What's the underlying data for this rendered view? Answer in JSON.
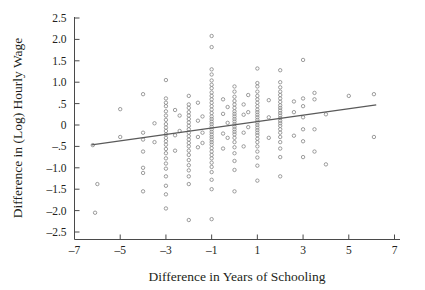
{
  "figure": {
    "background_color": "#ffffff",
    "ink_color": "#231f20",
    "axis_color": "#4a4a4a",
    "marker_color": "#8a8a8a",
    "fitline_color": "#5a5a5a"
  },
  "chart_data": {
    "type": "scatter",
    "title": "",
    "subtitle": "",
    "xlabel": "Difference in Years of Schooling",
    "ylabel": "Difference in (Log) Hourly Wage",
    "xlim": [
      -7,
      7
    ],
    "ylim": [
      -2.5,
      2.5
    ],
    "grid": false,
    "legend": null,
    "xticks": [
      -7,
      -5,
      -3,
      -1,
      1,
      3,
      5,
      7
    ],
    "xticklabels": [
      "–7",
      "–5",
      "–3",
      "–1",
      "1",
      "3",
      "5",
      "7"
    ],
    "yticks": [
      2.5,
      2.0,
      1.5,
      1.0,
      0.5,
      0,
      -0.5,
      -1.0,
      -1.5,
      -2.0,
      -2.5
    ],
    "yticklabels": [
      "2.5",
      "2.0",
      "1.5",
      "1.0",
      ".5",
      "0",
      "–.5",
      "–1.0",
      "–1.5",
      "–2.0",
      "–2.5"
    ],
    "annotations": [],
    "series": [
      {
        "name": "twin pairs",
        "marker": "open-circle",
        "points": [
          [
            -6.2,
            -0.47
          ],
          [
            -6.0,
            -1.38
          ],
          [
            -6.1,
            -2.05
          ],
          [
            -5.0,
            0.37
          ],
          [
            -5.0,
            -0.28
          ],
          [
            -4.0,
            0.72
          ],
          [
            -4.0,
            -0.18
          ],
          [
            -4.0,
            -0.34
          ],
          [
            -4.0,
            -0.62
          ],
          [
            -4.0,
            -1.0
          ],
          [
            -4.0,
            -1.12
          ],
          [
            -4.0,
            -1.55
          ],
          [
            -3.5,
            0.04
          ],
          [
            -3.5,
            -0.4
          ],
          [
            -3.0,
            1.05
          ],
          [
            -3.0,
            0.62
          ],
          [
            -3.0,
            0.52
          ],
          [
            -3.0,
            0.44
          ],
          [
            -3.0,
            0.32
          ],
          [
            -3.0,
            0.22
          ],
          [
            -3.0,
            0.12
          ],
          [
            -3.0,
            0.02
          ],
          [
            -3.0,
            -0.06
          ],
          [
            -3.0,
            -0.14
          ],
          [
            -3.0,
            -0.22
          ],
          [
            -3.0,
            -0.3
          ],
          [
            -3.0,
            -0.38
          ],
          [
            -3.0,
            -0.46
          ],
          [
            -3.0,
            -0.56
          ],
          [
            -3.0,
            -0.66
          ],
          [
            -3.0,
            -0.78
          ],
          [
            -3.0,
            -0.9
          ],
          [
            -3.0,
            -1.02
          ],
          [
            -3.0,
            -1.2
          ],
          [
            -3.0,
            -1.42
          ],
          [
            -3.0,
            -1.62
          ],
          [
            -3.0,
            -1.95
          ],
          [
            -2.6,
            0.35
          ],
          [
            -2.6,
            -0.24
          ],
          [
            -2.6,
            -0.6
          ],
          [
            -2.4,
            0.22
          ],
          [
            -2.4,
            -0.14
          ],
          [
            -2.0,
            0.68
          ],
          [
            -2.0,
            0.48
          ],
          [
            -2.0,
            0.4
          ],
          [
            -2.0,
            0.3
          ],
          [
            -2.0,
            0.22
          ],
          [
            -2.0,
            0.14
          ],
          [
            -2.0,
            0.06
          ],
          [
            -2.0,
            -0.02
          ],
          [
            -2.0,
            -0.1
          ],
          [
            -2.0,
            -0.18
          ],
          [
            -2.0,
            -0.26
          ],
          [
            -2.0,
            -0.34
          ],
          [
            -2.0,
            -0.42
          ],
          [
            -2.0,
            -0.5
          ],
          [
            -2.0,
            -0.6
          ],
          [
            -2.0,
            -0.7
          ],
          [
            -2.0,
            -0.82
          ],
          [
            -2.0,
            -0.94
          ],
          [
            -2.0,
            -1.06
          ],
          [
            -2.0,
            -1.2
          ],
          [
            -2.0,
            -1.38
          ],
          [
            -2.0,
            -2.22
          ],
          [
            -1.6,
            0.52
          ],
          [
            -1.6,
            0.1
          ],
          [
            -1.6,
            -0.28
          ],
          [
            -1.6,
            -0.52
          ],
          [
            -1.4,
            0.2
          ],
          [
            -1.4,
            -0.18
          ],
          [
            -1.4,
            -0.42
          ],
          [
            -1.0,
            2.08
          ],
          [
            -1.0,
            1.82
          ],
          [
            -1.0,
            1.3
          ],
          [
            -1.0,
            1.18
          ],
          [
            -1.0,
            1.04
          ],
          [
            -1.0,
            0.94
          ],
          [
            -1.0,
            0.86
          ],
          [
            -1.0,
            0.76
          ],
          [
            -1.0,
            0.68
          ],
          [
            -1.0,
            0.6
          ],
          [
            -1.0,
            0.52
          ],
          [
            -1.0,
            0.44
          ],
          [
            -1.0,
            0.36
          ],
          [
            -1.0,
            0.28
          ],
          [
            -1.0,
            0.2
          ],
          [
            -1.0,
            0.14
          ],
          [
            -1.0,
            0.08
          ],
          [
            -1.0,
            0.02
          ],
          [
            -1.0,
            -0.04
          ],
          [
            -1.0,
            -0.1
          ],
          [
            -1.0,
            -0.16
          ],
          [
            -1.0,
            -0.22
          ],
          [
            -1.0,
            -0.28
          ],
          [
            -1.0,
            -0.34
          ],
          [
            -1.0,
            -0.4
          ],
          [
            -1.0,
            -0.46
          ],
          [
            -1.0,
            -0.54
          ],
          [
            -1.0,
            -0.62
          ],
          [
            -1.0,
            -0.7
          ],
          [
            -1.0,
            -0.78
          ],
          [
            -1.0,
            -0.88
          ],
          [
            -1.0,
            -0.98
          ],
          [
            -1.0,
            -1.1
          ],
          [
            -1.0,
            -1.28
          ],
          [
            -1.0,
            -1.5
          ],
          [
            -1.0,
            -2.2
          ],
          [
            -0.5,
            0.6
          ],
          [
            -0.5,
            0.26
          ],
          [
            -0.5,
            -0.2
          ],
          [
            -0.5,
            -0.55
          ],
          [
            -0.3,
            0.42
          ],
          [
            -0.3,
            0.05
          ],
          [
            -0.3,
            -0.3
          ],
          [
            0.0,
            0.9
          ],
          [
            0.0,
            0.78
          ],
          [
            0.0,
            0.66
          ],
          [
            0.0,
            0.56
          ],
          [
            0.0,
            0.48
          ],
          [
            0.0,
            0.4
          ],
          [
            0.0,
            0.32
          ],
          [
            0.0,
            0.26
          ],
          [
            0.0,
            0.2
          ],
          [
            0.0,
            0.14
          ],
          [
            0.0,
            0.08
          ],
          [
            0.0,
            0.02
          ],
          [
            0.0,
            -0.04
          ],
          [
            0.0,
            -0.1
          ],
          [
            0.0,
            -0.16
          ],
          [
            0.0,
            -0.22
          ],
          [
            0.0,
            -0.3
          ],
          [
            0.0,
            -0.4
          ],
          [
            0.0,
            -0.52
          ],
          [
            0.0,
            -0.66
          ],
          [
            0.0,
            -0.84
          ],
          [
            0.0,
            -1.05
          ],
          [
            0.0,
            -1.55
          ],
          [
            0.4,
            0.48
          ],
          [
            0.4,
            0.24
          ],
          [
            0.4,
            -0.18
          ],
          [
            0.4,
            -0.5
          ],
          [
            0.6,
            0.7
          ],
          [
            0.6,
            0.3
          ],
          [
            0.6,
            -0.05
          ],
          [
            1.0,
            1.32
          ],
          [
            1.0,
            0.98
          ],
          [
            1.0,
            0.9
          ],
          [
            1.0,
            0.78
          ],
          [
            1.0,
            0.68
          ],
          [
            1.0,
            0.6
          ],
          [
            1.0,
            0.52
          ],
          [
            1.0,
            0.44
          ],
          [
            1.0,
            0.36
          ],
          [
            1.0,
            0.3
          ],
          [
            1.0,
            0.24
          ],
          [
            1.0,
            0.18
          ],
          [
            1.0,
            0.12
          ],
          [
            1.0,
            0.06
          ],
          [
            1.0,
            0.0
          ],
          [
            1.0,
            -0.06
          ],
          [
            1.0,
            -0.12
          ],
          [
            1.0,
            -0.18
          ],
          [
            1.0,
            -0.24
          ],
          [
            1.0,
            -0.32
          ],
          [
            1.0,
            -0.4
          ],
          [
            1.0,
            -0.5
          ],
          [
            1.0,
            -0.62
          ],
          [
            1.0,
            -0.76
          ],
          [
            1.0,
            -0.95
          ],
          [
            1.0,
            -1.3
          ],
          [
            1.5,
            0.58
          ],
          [
            1.5,
            0.18
          ],
          [
            1.5,
            -0.3
          ],
          [
            2.0,
            1.28
          ],
          [
            2.0,
            1.0
          ],
          [
            2.0,
            0.88
          ],
          [
            2.0,
            0.78
          ],
          [
            2.0,
            0.7
          ],
          [
            2.0,
            0.62
          ],
          [
            2.0,
            0.54
          ],
          [
            2.0,
            0.46
          ],
          [
            2.0,
            0.4
          ],
          [
            2.0,
            0.34
          ],
          [
            2.0,
            0.28
          ],
          [
            2.0,
            0.22
          ],
          [
            2.0,
            0.16
          ],
          [
            2.0,
            0.1
          ],
          [
            2.0,
            0.04
          ],
          [
            2.0,
            -0.02
          ],
          [
            2.0,
            -0.1
          ],
          [
            2.0,
            -0.18
          ],
          [
            2.0,
            -0.28
          ],
          [
            2.0,
            -0.4
          ],
          [
            2.0,
            -0.55
          ],
          [
            2.0,
            -0.75
          ],
          [
            2.0,
            -1.2
          ],
          [
            2.6,
            0.55
          ],
          [
            2.6,
            0.3
          ],
          [
            2.6,
            -0.25
          ],
          [
            3.0,
            1.52
          ],
          [
            3.0,
            0.62
          ],
          [
            3.0,
            0.44
          ],
          [
            3.0,
            0.18
          ],
          [
            3.0,
            -0.1
          ],
          [
            3.0,
            -0.38
          ],
          [
            3.0,
            -0.75
          ],
          [
            3.5,
            0.75
          ],
          [
            3.5,
            0.6
          ],
          [
            3.5,
            -0.1
          ],
          [
            3.5,
            -0.62
          ],
          [
            4.0,
            0.25
          ],
          [
            4.0,
            -0.92
          ],
          [
            5.0,
            0.68
          ],
          [
            6.1,
            0.72
          ],
          [
            6.1,
            -0.28
          ]
        ]
      }
    ],
    "fit_line": {
      "name": "fitted regression line",
      "x0": -6.25,
      "y0": -0.465,
      "x1": 6.2,
      "y1": 0.47,
      "slope": 0.075,
      "intercept": 0.005
    }
  }
}
